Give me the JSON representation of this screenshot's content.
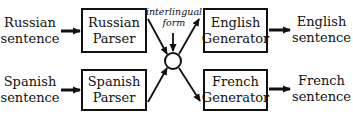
{
  "inputs": [
    {
      "line1": "Russian",
      "line2": "sentence"
    },
    {
      "line1": "Spanish",
      "line2": "sentence"
    }
  ],
  "parsers": [
    {
      "line1": "Russian",
      "line2": "Parser"
    },
    {
      "line1": "Spanish",
      "line2": "Parser"
    }
  ],
  "interlingua": {
    "line1": "interlingual",
    "line2": "form"
  },
  "generators": [
    {
      "line1": "English",
      "line2": "Generator"
    },
    {
      "line1": "French",
      "line2": "Generator"
    }
  ],
  "outputs": [
    {
      "line1": "English",
      "line2": "sentence"
    },
    {
      "line1": "French",
      "line2": "sentence"
    }
  ]
}
